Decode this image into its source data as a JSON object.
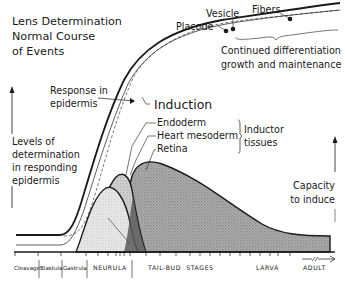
{
  "title": [
    "Lens Determination",
    "Normal Course",
    "of Events"
  ],
  "top_labels": {
    "placode": "Placode",
    "vesicle": "Vesicle",
    "fibers": "Fibers",
    "continued": [
      "Continued differentiation",
      "growth and maintenance"
    ]
  },
  "response_label": [
    "Response in",
    "epidermis"
  ],
  "induction_label": "Induction",
  "inductors": {
    "items": [
      "Endoderm",
      "Heart mesoderm",
      "Retina"
    ],
    "group_label": [
      "Inductor",
      "tissues"
    ]
  },
  "left_axis_label": [
    "Levels of",
    "determination",
    "in responding",
    "epidermis"
  ],
  "right_axis_label": [
    "Capacity",
    "to induce"
  ],
  "stages": [
    {
      "label": "Cleavage"
    },
    {
      "label": "Blastula"
    },
    {
      "label": "Gastrula"
    },
    {
      "label": "NEURULA"
    },
    {
      "label": "TAIL-BUD  STAGES"
    },
    {
      "label": "LARVA"
    },
    {
      "label": "ADULT"
    }
  ],
  "colors": {
    "ink": "#1a1a1a",
    "endoderm_fill": "#e2e2e2",
    "heart_fill": "#c4c4c4",
    "retina_fill": "#a9a9a9",
    "overlap_fill": "#555555"
  }
}
